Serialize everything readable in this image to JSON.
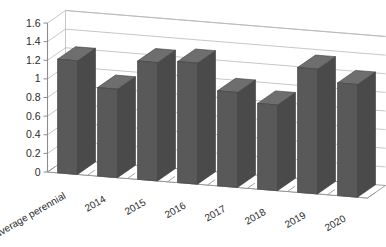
{
  "chart_data": {
    "type": "bar",
    "title": "",
    "subtitle": "",
    "xlabel": "",
    "ylabel": "",
    "categories": [
      "average perennial",
      "2014",
      "2015",
      "2016",
      "2017",
      "2018",
      "2019",
      "2020"
    ],
    "values": [
      1.22,
      0.95,
      1.27,
      1.3,
      1.02,
      0.92,
      1.34,
      1.21
    ],
    "series": [
      {
        "name": "",
        "values": [
          1.22,
          0.95,
          1.27,
          1.3,
          1.02,
          0.92,
          1.34,
          1.21
        ]
      }
    ],
    "ylim": [
      0,
      1.6
    ],
    "ytick_values": [
      0,
      0.2,
      0.4,
      0.6,
      0.8,
      1.0,
      1.2,
      1.4,
      1.6
    ],
    "ytick_labels": [
      "0",
      "0.2",
      "0.4",
      "0.6",
      "0.8",
      "1",
      "1.2",
      "1.4",
      "1.6"
    ],
    "grid": true,
    "grid_axis": "y",
    "legend": false,
    "legend_position": "none",
    "style": "3d-column",
    "bar_color": "#595959",
    "bar_side_color": "#4a4a4a",
    "bar_top_color": "#6e6e6e",
    "grid_color": "#b9b9b9",
    "axis_color": "#8c8c8c",
    "background_color": "#ffffff",
    "annotations": []
  },
  "axis": {
    "y_ticks": [
      {
        "label": "1.6",
        "value": 1.6
      },
      {
        "label": "1.4",
        "value": 1.4
      },
      {
        "label": "1.2",
        "value": 1.2
      },
      {
        "label": "1",
        "value": 1.0
      },
      {
        "label": "0.8",
        "value": 0.8
      },
      {
        "label": "0.6",
        "value": 0.6
      },
      {
        "label": "0.4",
        "value": 0.4
      },
      {
        "label": "0.2",
        "value": 0.2
      },
      {
        "label": "0",
        "value": 0.0
      }
    ],
    "x_ticks": [
      {
        "label": "average perennial"
      },
      {
        "label": "2014"
      },
      {
        "label": "2015"
      },
      {
        "label": "2016"
      },
      {
        "label": "2017"
      },
      {
        "label": "2018"
      },
      {
        "label": "2019"
      },
      {
        "label": "2020"
      }
    ]
  }
}
